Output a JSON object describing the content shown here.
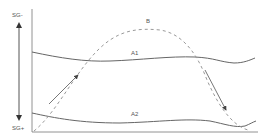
{
  "diagram": {
    "axis": {
      "top_label": "SG-",
      "bottom_label": "SG+"
    },
    "curves": [
      {
        "id": "A1",
        "label": "A1",
        "style": "solid"
      },
      {
        "id": "A2",
        "label": "A2",
        "style": "solid"
      },
      {
        "id": "B",
        "label": "B",
        "style": "dashed"
      }
    ],
    "arrows": [
      {
        "id": "rising",
        "direction": "up-right"
      },
      {
        "id": "falling",
        "direction": "down-right"
      }
    ],
    "colors": {
      "line": "#666666",
      "dashed": "#999999",
      "text": "#555555"
    }
  }
}
